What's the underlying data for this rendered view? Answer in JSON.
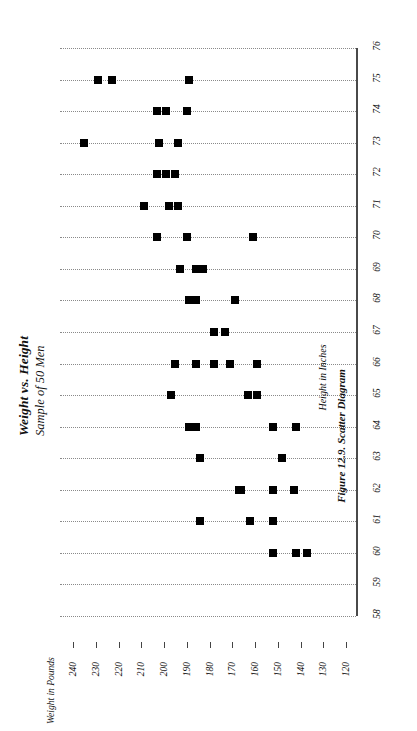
{
  "figure": {
    "title": "Weight vs. Height",
    "subtitle": "Sample of 50 Men",
    "caption": "Figure 12.9. Scatter Diagram",
    "category_axis_title": "Height in Inches",
    "value_axis_title": "Weight in Pounds",
    "rotation_note": "90-degree-counterclockwise"
  },
  "chart_data": {
    "type": "scatter",
    "title": "Weight vs. Height",
    "subtitle": "Sample of 50 Men",
    "caption": "Figure 12.9. Scatter Diagram",
    "xlabel": "Height in Inches",
    "ylabel": "Weight in Pounds",
    "orientation": "rotated-90-ccw",
    "grid": true,
    "grid_style": "dotted",
    "legend": "none",
    "marker": "filled-square",
    "marker_color": "#000000",
    "xlim": [
      58,
      76
    ],
    "ylim": [
      120,
      240
    ],
    "xticks": [
      58,
      59,
      60,
      61,
      62,
      63,
      64,
      65,
      66,
      67,
      68,
      69,
      70,
      71,
      72,
      73,
      74,
      75,
      76
    ],
    "yticks": [
      240,
      230,
      220,
      210,
      200,
      190,
      180,
      170,
      160,
      150,
      140,
      130,
      120
    ],
    "ytick_order": "descending",
    "n_points": 50,
    "points": [
      {
        "x": 60,
        "y": 152
      },
      {
        "x": 60,
        "y": 142
      },
      {
        "x": 60,
        "y": 137
      },
      {
        "x": 61,
        "y": 184
      },
      {
        "x": 61,
        "y": 162
      },
      {
        "x": 61,
        "y": 152
      },
      {
        "x": 62,
        "y": 166
      },
      {
        "x": 62,
        "y": 152
      },
      {
        "x": 62,
        "y": 143
      },
      {
        "x": 63,
        "y": 184
      },
      {
        "x": 63,
        "y": 148
      },
      {
        "x": 64,
        "y": 189
      },
      {
        "x": 64,
        "y": 152
      },
      {
        "x": 64,
        "y": 142
      },
      {
        "x": 65,
        "y": 197
      },
      {
        "x": 65,
        "y": 163
      },
      {
        "x": 65,
        "y": 159
      },
      {
        "x": 66,
        "y": 195
      },
      {
        "x": 66,
        "y": 178
      },
      {
        "x": 66,
        "y": 171
      },
      {
        "x": 66,
        "y": 159
      },
      {
        "x": 67,
        "y": 178
      },
      {
        "x": 67,
        "y": 173
      },
      {
        "x": 68,
        "y": 189
      },
      {
        "x": 68,
        "y": 169
      },
      {
        "x": 69,
        "y": 193
      },
      {
        "x": 69,
        "y": 183
      },
      {
        "x": 70,
        "y": 203
      },
      {
        "x": 70,
        "y": 190
      },
      {
        "x": 70,
        "y": 161
      },
      {
        "x": 71,
        "y": 209
      },
      {
        "x": 71,
        "y": 198
      },
      {
        "x": 71,
        "y": 194
      },
      {
        "x": 72,
        "y": 203
      },
      {
        "x": 72,
        "y": 199
      },
      {
        "x": 72,
        "y": 195
      },
      {
        "x": 73,
        "y": 235
      },
      {
        "x": 73,
        "y": 202
      },
      {
        "x": 73,
        "y": 194
      },
      {
        "x": 74,
        "y": 203
      },
      {
        "x": 74,
        "y": 199
      },
      {
        "x": 74,
        "y": 190
      },
      {
        "x": 75,
        "y": 229
      },
      {
        "x": 75,
        "y": 223
      },
      {
        "x": 75,
        "y": 189
      },
      {
        "x": 66,
        "y": 186
      },
      {
        "x": 64,
        "y": 186
      },
      {
        "x": 62,
        "y": 167
      },
      {
        "x": 69,
        "y": 186
      },
      {
        "x": 68,
        "y": 186
      }
    ]
  }
}
